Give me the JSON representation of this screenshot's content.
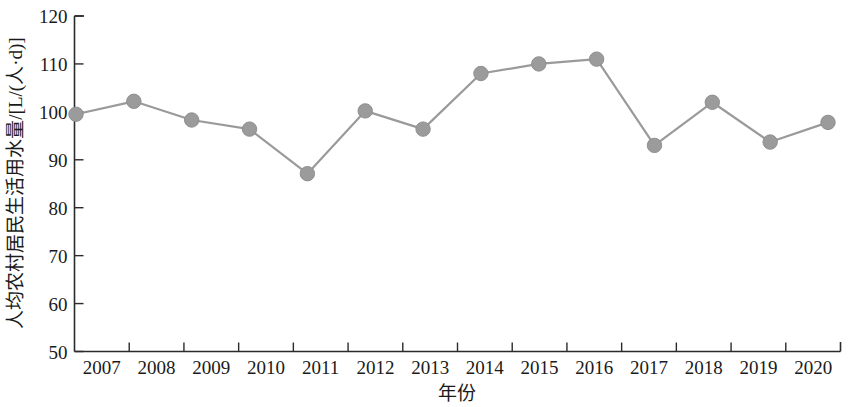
{
  "chart_data": {
    "type": "line",
    "title": "",
    "subtitle": "",
    "xlabel": "年份",
    "ylabel": "人均农村居民生活用水量/[L/(人·d)]",
    "categories": [
      "2007",
      "2008",
      "2009",
      "2010",
      "2011",
      "2012",
      "2013",
      "2014",
      "2015",
      "2016",
      "2017",
      "2018",
      "2019",
      "2020"
    ],
    "values": [
      99.5,
      102.2,
      98.3,
      96.4,
      87.1,
      100.2,
      96.4,
      108.0,
      110.0,
      111.0,
      93.0,
      102.0,
      93.7,
      97.8
    ],
    "series": [
      {
        "name": "人均农村居民生活用水量",
        "values": [
          99.5,
          102.2,
          98.3,
          96.4,
          87.1,
          100.2,
          96.4,
          108.0,
          110.0,
          111.0,
          93.0,
          102.0,
          93.7,
          97.8
        ]
      }
    ],
    "ylim": [
      50,
      120
    ],
    "yticks": [
      50,
      60,
      70,
      80,
      90,
      100,
      110,
      120
    ],
    "ytick_labels": [
      "50",
      "60",
      "70",
      "80",
      "90",
      "100",
      "110",
      "120"
    ],
    "xtick_labels": [
      "2007",
      "2008",
      "2009",
      "2010",
      "2011",
      "2012",
      "2013",
      "2014",
      "2015",
      "2016",
      "2017",
      "2018",
      "2019",
      "2020"
    ],
    "grid": false,
    "legend": null,
    "legend_position": "none",
    "annotations": [],
    "colors": {
      "line": "#9a9a9a",
      "marker": "#9b9b9b",
      "axis": "#2b2b2b",
      "text": "#1a1a1a",
      "background": "#ffffff"
    }
  }
}
